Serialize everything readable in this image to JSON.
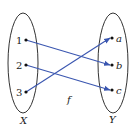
{
  "diagram": {
    "type": "function-mapping",
    "function_label": "f",
    "domain": {
      "label": "X",
      "elements": [
        "1",
        "2",
        "3"
      ]
    },
    "codomain": {
      "label": "Y",
      "elements": [
        "a",
        "b",
        "c"
      ]
    },
    "mapping": [
      {
        "from": "1",
        "to": "b"
      },
      {
        "from": "2",
        "to": "c"
      },
      {
        "from": "3",
        "to": "a"
      }
    ],
    "colors": {
      "arrow": "#3a56b0",
      "outline": "#333333",
      "dot": "#111111"
    }
  }
}
